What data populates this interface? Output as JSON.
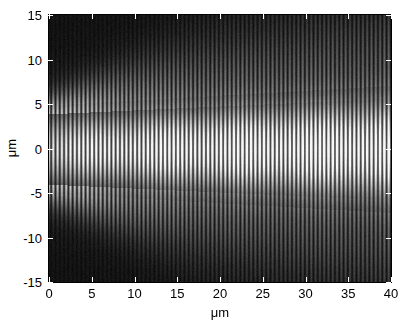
{
  "figure": {
    "background": "#ffffff",
    "colormap": "gray",
    "axis_color": "#000000",
    "tick_color": "#ffffff"
  },
  "chart_data": {
    "type": "heatmap",
    "title": "",
    "xlabel": "μm",
    "ylabel": "μm",
    "xlim": [
      0,
      40
    ],
    "ylim": [
      -15,
      15
    ],
    "xticks": [
      0,
      5,
      10,
      15,
      20,
      25,
      30,
      35,
      40
    ],
    "yticks": [
      15,
      10,
      5,
      0,
      -5,
      -10,
      -15
    ],
    "xticklabels": [
      "0",
      "5",
      "10",
      "15",
      "20",
      "25",
      "30",
      "35",
      "40"
    ],
    "yticklabels": [
      "15",
      "10",
      "5",
      "0",
      "-5",
      "-10",
      "-15"
    ],
    "grid": false,
    "legend": false,
    "colorbar": false,
    "colormap": "gray",
    "zlim": [
      0,
      1
    ],
    "model": {
      "fringe_period_um": 0.5,
      "fringe_contrast": 0.82,
      "core_halfwidth_um": 4.9,
      "core_edge_softness_um": 1.25,
      "spread_rate": 0.055,
      "lobe_angle_slope": 0.34,
      "lobe_count": 4,
      "lobe_amplitude": 0.2,
      "lobe_decay_um": 11.0,
      "axial_brightening": 0.5,
      "axial_scale_um": 17.0,
      "center_lobe_period_um": 9.0,
      "center_lobe_depth": 0.22,
      "background_level": 0.045,
      "noise_amplitude": 0.035,
      "gamma": 0.92,
      "white_level": 0.97,
      "seed": 20240517
    }
  }
}
